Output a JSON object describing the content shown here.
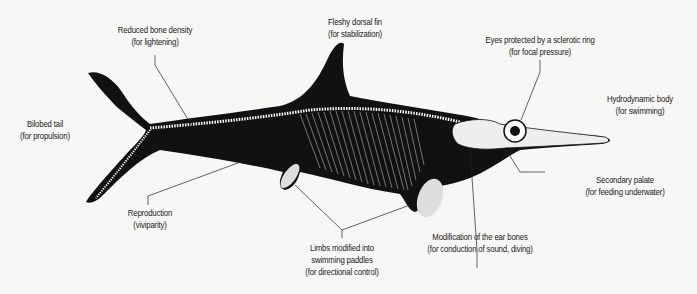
{
  "diagram": {
    "colors": {
      "background": "#f7f7f5",
      "body": "#111111",
      "bone": "#ffffff",
      "line": "#222222"
    },
    "labels": [
      {
        "id": "bone-density",
        "title": "Reduced bone density",
        "note": "(for lightening)"
      },
      {
        "id": "dorsal-fin",
        "title": "Fleshy dorsal fin",
        "note": "(for stabilization)"
      },
      {
        "id": "sclerotic-ring",
        "title": "Eyes protected by a sclerotic ring",
        "note": "(for focal pressure)"
      },
      {
        "id": "hydrodynamic",
        "title": "Hydrodynamic body",
        "note": "(for swimming)"
      },
      {
        "id": "bilobed-tail",
        "title": "Bilobed tail",
        "note": "(for propulsion)"
      },
      {
        "id": "secondary-palate",
        "title": "Secondary palate",
        "note": "(for feeding underwater)"
      },
      {
        "id": "reproduction",
        "title": "Reproduction",
        "note": "(viviparity)"
      },
      {
        "id": "limbs",
        "title": "Limbs modified into",
        "title2": "swimming paddles",
        "note": "(for directional control)"
      },
      {
        "id": "ear-bones",
        "title": "Modification of the ear bones",
        "note": "(for conduction of sound, diving)"
      }
    ]
  }
}
